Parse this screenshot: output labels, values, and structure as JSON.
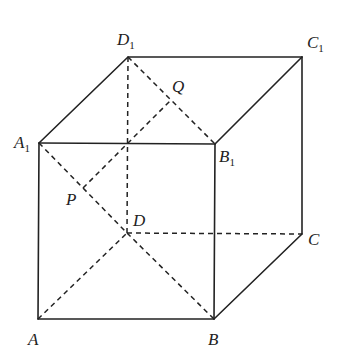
{
  "figure": {
    "vertices": [
      {
        "name": "A",
        "base": "A",
        "sub": ""
      },
      {
        "name": "B",
        "base": "B",
        "sub": ""
      },
      {
        "name": "C",
        "base": "C",
        "sub": ""
      },
      {
        "name": "D",
        "base": "D",
        "sub": ""
      },
      {
        "name": "A1",
        "base": "A",
        "sub": "1"
      },
      {
        "name": "B1",
        "base": "B",
        "sub": "1"
      },
      {
        "name": "C1",
        "base": "C",
        "sub": "1"
      },
      {
        "name": "D1",
        "base": "D",
        "sub": "1"
      },
      {
        "name": "P",
        "base": "P",
        "sub": ""
      },
      {
        "name": "Q",
        "base": "Q",
        "sub": ""
      }
    ],
    "solid_edges": [
      [
        "A",
        "B"
      ],
      [
        "B",
        "C"
      ],
      [
        "C",
        "C1"
      ],
      [
        "C1",
        "D1"
      ],
      [
        "D1",
        "A1"
      ],
      [
        "A1",
        "A"
      ],
      [
        "A1",
        "B1"
      ],
      [
        "B1",
        "C1"
      ],
      [
        "B",
        "B1"
      ]
    ],
    "dashed_edges": [
      [
        "A",
        "D"
      ],
      [
        "D",
        "C"
      ],
      [
        "D",
        "D1"
      ],
      [
        "D1",
        "B1"
      ],
      [
        "A1",
        "D"
      ],
      [
        "D",
        "B"
      ],
      [
        "P",
        "Q"
      ]
    ]
  }
}
